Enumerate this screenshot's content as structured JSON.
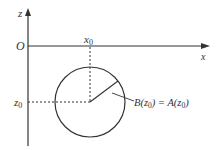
{
  "diagram": {
    "axes": {
      "z_label": "z",
      "x_label": "x",
      "origin_label": "O"
    },
    "markers": {
      "x0_label": "x",
      "x0_sub": "0",
      "z0_label": "z",
      "z0_sub": "0"
    },
    "annotation": {
      "left_fn": "B(z",
      "left_sub": "0",
      "mid": ") = A(z",
      "right_sub": "0",
      "close": ")"
    },
    "colors": {
      "stroke": "#333333",
      "background": "#ffffff"
    },
    "geometry": {
      "circle_center": [
        90,
        102
      ],
      "circle_radius": 35
    }
  }
}
